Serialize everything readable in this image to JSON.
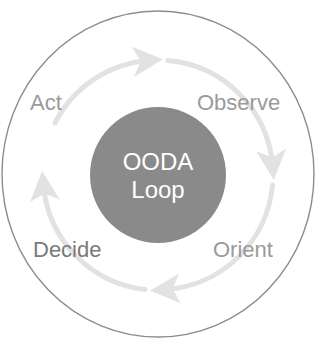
{
  "diagram": {
    "type": "cycle",
    "center": {
      "line1": "OODA",
      "line2": "Loop"
    },
    "stages": [
      {
        "label": "Observe",
        "position": "upper-right",
        "color": "#9a9a9a"
      },
      {
        "label": "Orient",
        "position": "lower-right",
        "color": "#9a9a9a"
      },
      {
        "label": "Decide",
        "position": "lower-left",
        "color": "#7a7a7a"
      },
      {
        "label": "Act",
        "position": "upper-left",
        "color": "#9a9a9a"
      }
    ],
    "flow_direction": "clockwise",
    "colors": {
      "outer_ring": "#8c8c8c",
      "center_fill": "#8a8a8a",
      "center_text": "#ffffff",
      "arrows": "#e2e2e2"
    }
  }
}
